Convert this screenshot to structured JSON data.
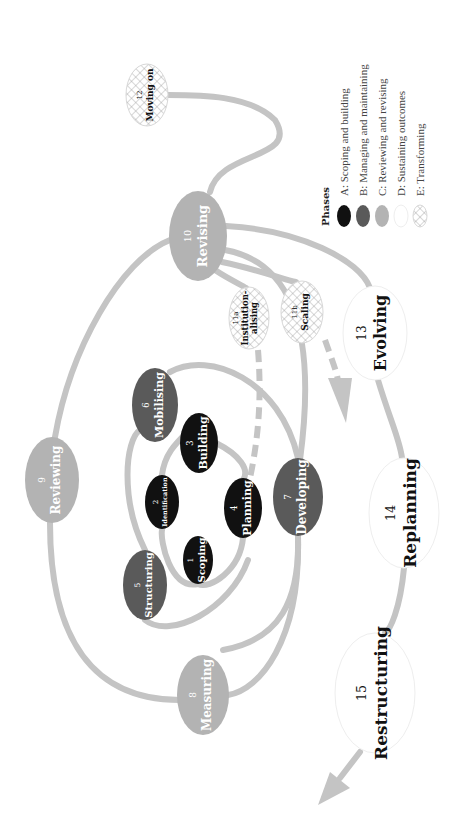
{
  "diagram": {
    "orientation": "rotated-90-ccw",
    "colors": {
      "track": "#c4c4c4",
      "phase_A": "#111111",
      "phase_B": "#5a5a5a",
      "phase_C": "#b3b3b3",
      "phase_D": "#ffffff",
      "phase_E_pattern": "#9a9a9a",
      "text_dark": "#111111",
      "text_light": "#ffffff"
    },
    "nodes": [
      {
        "id": "1",
        "number": "1",
        "label": "Scoping",
        "label2": "",
        "phase": "A",
        "cx": 198,
        "cy": 560,
        "rx": 15,
        "ry": 24,
        "fs": 10
      },
      {
        "id": "2",
        "number": "2",
        "label": "Identification",
        "label2": "",
        "phase": "A",
        "cx": 162,
        "cy": 502,
        "rx": 17,
        "ry": 27,
        "fs": 6.5
      },
      {
        "id": "3",
        "number": "3",
        "label": "Building",
        "label2": "",
        "phase": "A",
        "cx": 199,
        "cy": 443,
        "rx": 19,
        "ry": 30,
        "fs": 11
      },
      {
        "id": "4",
        "number": "4",
        "label": "Planning",
        "label2": "",
        "phase": "A",
        "cx": 243,
        "cy": 508,
        "rx": 19,
        "ry": 30,
        "fs": 11
      },
      {
        "id": "5",
        "number": "5",
        "label": "Structuring",
        "label2": "",
        "phase": "B",
        "cx": 145,
        "cy": 585,
        "rx": 22,
        "ry": 35,
        "fs": 10
      },
      {
        "id": "6",
        "number": "6",
        "label": "Mobilising",
        "label2": "",
        "phase": "B",
        "cx": 155,
        "cy": 405,
        "rx": 23,
        "ry": 37,
        "fs": 11
      },
      {
        "id": "7",
        "number": "7",
        "label": "Developing",
        "label2": "",
        "phase": "B",
        "cx": 298,
        "cy": 497,
        "rx": 25,
        "ry": 39,
        "fs": 12
      },
      {
        "id": "8",
        "number": "8",
        "label": "Measuring",
        "label2": "",
        "phase": "C",
        "cx": 203,
        "cy": 695,
        "rx": 26,
        "ry": 40,
        "fs": 12
      },
      {
        "id": "9",
        "number": "9",
        "label": "Reviewing",
        "label2": "",
        "phase": "C",
        "cx": 52,
        "cy": 480,
        "rx": 27,
        "ry": 43,
        "fs": 12
      },
      {
        "id": "10",
        "number": "10",
        "label": "Revising",
        "label2": "",
        "phase": "C",
        "cx": 198,
        "cy": 236,
        "rx": 29,
        "ry": 45,
        "fs": 13
      },
      {
        "id": "11a",
        "number": "11a",
        "label": "Institution-",
        "label2": "alising",
        "phase": "E",
        "cx": 249,
        "cy": 318,
        "rx": 20,
        "ry": 31,
        "fs": 8.5
      },
      {
        "id": "11b",
        "number": "11b",
        "label": "Scaling",
        "label2": "",
        "phase": "E",
        "cx": 302,
        "cy": 312,
        "rx": 21,
        "ry": 31,
        "fs": 9
      },
      {
        "id": "12",
        "number": "12",
        "label": "Moving on",
        "label2": "",
        "phase": "E",
        "cx": 147,
        "cy": 95,
        "rx": 21,
        "ry": 31,
        "fs": 9
      },
      {
        "id": "13",
        "number": "13",
        "label": "Evolving",
        "label2": "",
        "phase": "D",
        "cx": 375,
        "cy": 333,
        "rx": 32,
        "ry": 47,
        "fs": 16
      },
      {
        "id": "14",
        "number": "14",
        "label": "Replanning",
        "label2": "",
        "phase": "D",
        "cx": 404,
        "cy": 513,
        "rx": 35,
        "ry": 55,
        "fs": 17
      },
      {
        "id": "15",
        "number": "15",
        "label": "Restructuring",
        "label2": "",
        "phase": "D",
        "cx": 375,
        "cy": 693,
        "rx": 40,
        "ry": 60,
        "fs": 17
      }
    ],
    "legend": {
      "title": "Phases",
      "items": [
        {
          "key": "A",
          "text": "A: Scoping and building"
        },
        {
          "key": "B",
          "text": "B: Managing and maintaining"
        },
        {
          "key": "C",
          "text": "C: Reviewing and revising"
        },
        {
          "key": "D",
          "text": "D: Sustaining outcomes"
        },
        {
          "key": "E",
          "text": "E: Transforming"
        }
      ]
    }
  }
}
